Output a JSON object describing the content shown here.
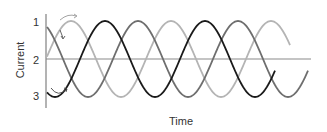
{
  "chart_data": {
    "type": "line",
    "title": "",
    "xlabel": "Time",
    "ylabel": "Current",
    "y_tick_labels": [
      "1",
      "2",
      "3"
    ],
    "grid": false,
    "legend": null,
    "annotations": [
      "curved arrow above first peak",
      "small arrow on descending curve",
      "curved arrow at first trough"
    ],
    "series": [
      {
        "name": "phase-black",
        "color": "#1a1a1a",
        "shape": "sine",
        "amplitude": 1,
        "period_px": 100,
        "first_trough_x": 55,
        "end_x": 275
      },
      {
        "name": "phase-dark-gray",
        "color": "#6e6e6e",
        "shape": "sine",
        "amplitude": 1,
        "period_px": 100,
        "first_trough_x": 88,
        "end_x": 308
      },
      {
        "name": "phase-light-gray",
        "color": "#b4b4b4",
        "shape": "sine",
        "amplitude": 1,
        "period_px": 100,
        "first_trough_x": 121,
        "end_x": 290
      }
    ],
    "phase_offset_degrees": 120,
    "ylim": [
      -1,
      1
    ]
  },
  "axes": {
    "x_label": "Time",
    "y_label": "Current",
    "ticks": [
      "1",
      "2",
      "3"
    ]
  }
}
